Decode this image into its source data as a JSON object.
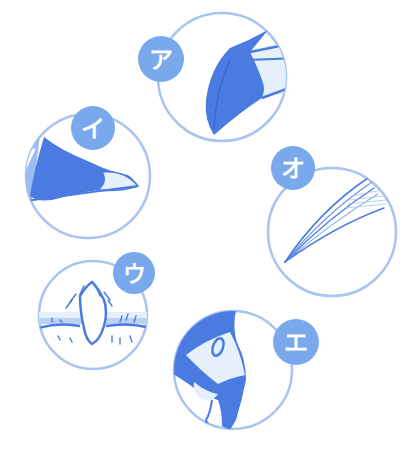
{
  "colors": {
    "outline": "#a8c4ef",
    "badge": "#7aa8ec",
    "fill_dark": "#4a7be0",
    "fill_light": "#e6f0fb",
    "fill_mid": "#9dbcf0",
    "background": "#ffffff"
  },
  "panels": [
    {
      "id": "a",
      "label": "ア",
      "subject": "beak-tip"
    },
    {
      "id": "i",
      "label": "イ",
      "subject": "beak-side"
    },
    {
      "id": "u",
      "label": "ウ",
      "subject": "tooth-in-gum"
    },
    {
      "id": "e",
      "label": "エ",
      "subject": "bird-head"
    },
    {
      "id": "o",
      "label": "オ",
      "subject": "feather-fibers"
    }
  ]
}
